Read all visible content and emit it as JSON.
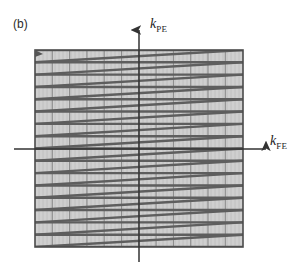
{
  "figure": {
    "panel_label": "(b)",
    "caption_domain": "k-space trajectory diagram",
    "background_color": "#ffffff"
  },
  "axes": {
    "vertical": {
      "name": "k-PE",
      "symbol": "k",
      "subscript": "PE",
      "x_px": 139,
      "top_px": 30,
      "bottom_px": 262,
      "arrow": "up",
      "color": "#333333"
    },
    "horizontal": {
      "name": "k-FE",
      "symbol": "k",
      "subscript": "FE",
      "y_px": 149,
      "left_px": 14,
      "right_px": 266,
      "arrow": "right",
      "color": "#333333"
    }
  },
  "plot_area": {
    "x": 35,
    "y": 50,
    "width": 208,
    "height": 197,
    "fill_color": "#cfcfcf",
    "border_color": "#4a4a4a",
    "grid_minor_color": "#bdbdbd",
    "grid_major_color": "#8c8c8c",
    "grid_minor_spacing_px": 4.0,
    "grid_major_spacing_px": 17.3,
    "grid_horizontal_spacing_px": 12.3
  },
  "chart_data": {
    "type": "line",
    "title": "",
    "subtitle": "",
    "xlabel": "k_FE",
    "ylabel": "k_PE",
    "grid": true,
    "legend": null,
    "legend_position": "none",
    "xlim": [
      -1,
      1
    ],
    "ylim": [
      -1,
      1
    ],
    "trajectory_name": "sequential Cartesian raster k-space trajectory",
    "line_color": "#5e5e5e",
    "line_width_px": 2.4,
    "start_marker": {
      "x": -1.0,
      "y": 1.0,
      "shape": "arrow",
      "color": "#555555"
    },
    "n_phase_encode_lines": 16,
    "readout_direction": "left-to-right",
    "series": [
      {
        "name": "readout-lines",
        "kind": "horizontal-readout",
        "y_values": [
          1.0,
          0.875,
          0.75,
          0.625,
          0.5,
          0.375,
          0.25,
          0.125,
          0.0,
          -0.125,
          -0.25,
          -0.375,
          -0.5,
          -0.625,
          -0.75,
          -0.875,
          -1.0
        ],
        "x_start": -1.0,
        "x_end": 1.0
      },
      {
        "name": "flyback-diagonals",
        "kind": "diagonal-return",
        "segments": [
          {
            "x1": 1.0,
            "y1": 1.0,
            "x2": -1.0,
            "y2": 0.875
          },
          {
            "x1": 1.0,
            "y1": 0.875,
            "x2": -1.0,
            "y2": 0.75
          },
          {
            "x1": 1.0,
            "y1": 0.75,
            "x2": -1.0,
            "y2": 0.625
          },
          {
            "x1": 1.0,
            "y1": 0.625,
            "x2": -1.0,
            "y2": 0.5
          },
          {
            "x1": 1.0,
            "y1": 0.5,
            "x2": -1.0,
            "y2": 0.375
          },
          {
            "x1": 1.0,
            "y1": 0.375,
            "x2": -1.0,
            "y2": 0.25
          },
          {
            "x1": 1.0,
            "y1": 0.25,
            "x2": -1.0,
            "y2": 0.125
          },
          {
            "x1": 1.0,
            "y1": 0.125,
            "x2": -1.0,
            "y2": 0.0
          },
          {
            "x1": 1.0,
            "y1": 0.0,
            "x2": -1.0,
            "y2": -0.125
          },
          {
            "x1": 1.0,
            "y1": -0.125,
            "x2": -1.0,
            "y2": -0.25
          },
          {
            "x1": 1.0,
            "y1": -0.25,
            "x2": -1.0,
            "y2": -0.375
          },
          {
            "x1": 1.0,
            "y1": -0.375,
            "x2": -1.0,
            "y2": -0.5
          },
          {
            "x1": 1.0,
            "y1": -0.5,
            "x2": -1.0,
            "y2": -0.625
          },
          {
            "x1": 1.0,
            "y1": -0.625,
            "x2": -1.0,
            "y2": -0.75
          },
          {
            "x1": 1.0,
            "y1": -0.75,
            "x2": -1.0,
            "y2": -0.875
          },
          {
            "x1": 1.0,
            "y1": -0.875,
            "x2": -1.0,
            "y2": -1.0
          }
        ]
      }
    ]
  }
}
